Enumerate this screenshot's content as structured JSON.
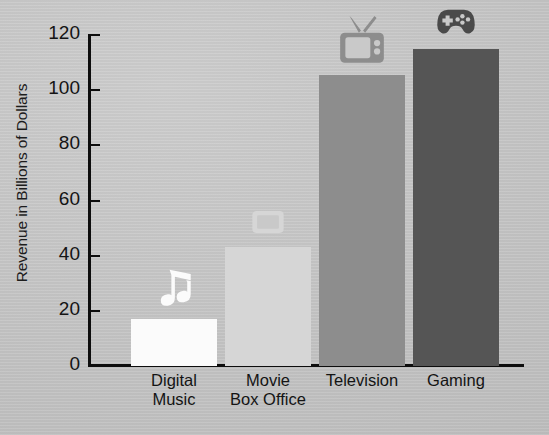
{
  "chart_data": {
    "type": "bar",
    "title": "",
    "subtitle": "",
    "xlabel": "",
    "ylabel": "Revenue in Billions of Dollars",
    "categories": [
      "Digital Music",
      "Movie Box Office",
      "Television",
      "Gaming"
    ],
    "category_lines": [
      [
        "Digital",
        "Music"
      ],
      [
        "Movie",
        "Box Office"
      ],
      [
        "Television"
      ],
      [
        "Gaming"
      ]
    ],
    "values": [
      17,
      43,
      105.5,
      115
    ],
    "ylim": [
      0,
      120
    ],
    "ytick_values": [
      0,
      20,
      40,
      60,
      80,
      100,
      120
    ],
    "ytick_labels": [
      "0",
      "20",
      "40",
      "60",
      "80",
      "100",
      "120"
    ],
    "grid": false,
    "legend": null,
    "legend_position": "none",
    "bar_colors": [
      "#fbfbfb",
      "#d6d6d6",
      "#8d8d8d",
      "#555555"
    ],
    "bar_icons": [
      "music-note-icon",
      "portable-screen-icon",
      "retro-television-icon",
      "game-controller-icon"
    ],
    "bar_icon_colors": [
      "#fbfbfb",
      "#d6d6d6",
      "#8d8d8d",
      "#4a4a4a"
    ],
    "series": [
      {
        "name": "Revenue",
        "values": [
          17,
          43,
          105.5,
          115
        ]
      }
    ],
    "annotations": []
  },
  "figure": {
    "background_color": "#c9c9c9",
    "axis_color": "#0d0d0d",
    "text_color": "#141414"
  }
}
